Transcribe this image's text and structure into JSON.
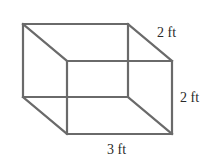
{
  "figure": {
    "type": "rectangular-prism",
    "edge_color": "#6a6a6a",
    "labels": {
      "depth": "2 ft",
      "height": "2 ft",
      "length": "3 ft"
    },
    "dimensions": {
      "length_ft": 3,
      "depth_ft": 2,
      "height_ft": 2
    }
  }
}
